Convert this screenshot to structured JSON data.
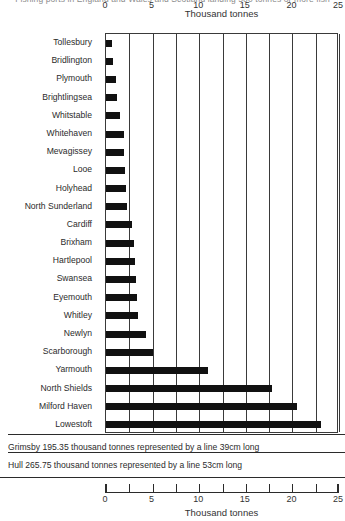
{
  "header": {
    "clipped_caption": "Fishing ports in England and Wales and Scotland landing 500 tonnes or more fish"
  },
  "chart_data": {
    "type": "bar",
    "orientation": "horizontal",
    "title": "",
    "xlabel": "Thousand tonnes",
    "ylabel": "",
    "xlim": [
      0,
      25
    ],
    "xticks": [
      0,
      5,
      10,
      15,
      20,
      25
    ],
    "grid": true,
    "grid_axis": "x",
    "legend": false,
    "categories": [
      "Tollesbury",
      "Bridlington",
      "Plymouth",
      "Brightlingsea",
      "Whitstable",
      "Whitehaven",
      "Mevagissey",
      "Looe",
      "Holyhead",
      "North Sunderland",
      "Cardiff",
      "Brixham",
      "Hartlepool",
      "Swansea",
      "Eyemouth",
      "Whitley",
      "Newlyn",
      "Scarborough",
      "Yarmouth",
      "North Shields",
      "Milford Haven",
      "Lowestoft"
    ],
    "values": [
      0.6,
      0.8,
      1.1,
      1.2,
      1.5,
      1.9,
      1.9,
      2.0,
      2.1,
      2.2,
      2.8,
      3.0,
      3.1,
      3.2,
      3.3,
      3.4,
      4.3,
      5.0,
      10.9,
      17.8,
      20.5,
      23.1
    ],
    "units": "thousand tonnes",
    "bar_color": "#111111",
    "axes": {
      "top_axis_label": "Thousand tonnes",
      "bottom_axis_label": "Thousand tonnes"
    }
  },
  "notes": [
    "Grimsby 195.35 thousand tonnes represented by a line 39cm long",
    "Hull 265.75 thousand tonnes represented by a line 53cm long"
  ]
}
